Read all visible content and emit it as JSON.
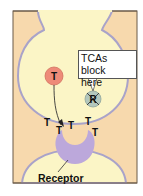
{
  "diagram": {
    "title": "",
    "colors": {
      "background_frame": "#f7d9ad",
      "frame_border": "#6b5a48",
      "neuron_fill": "#fbf5c6",
      "neuron_membrane": "#a9a3c9",
      "transmitter_vesicle": "#ee8a78",
      "reuptake_pump": "#b3c7bd",
      "receptor": "#bca8db",
      "text": "#111111"
    },
    "vesicle": {
      "label": "T"
    },
    "pump": {
      "label": "R"
    },
    "callout": {
      "line1": "TCAs block",
      "line2": "here"
    },
    "transmitters": [
      {
        "label": "T",
        "x": 47,
        "y": 126
      },
      {
        "label": "T",
        "x": 59,
        "y": 134
      },
      {
        "label": "T",
        "x": 71,
        "y": 129
      },
      {
        "label": "T",
        "x": 88,
        "y": 125
      },
      {
        "label": "T",
        "x": 95,
        "y": 136
      }
    ],
    "receptor_label": "Receptor"
  }
}
